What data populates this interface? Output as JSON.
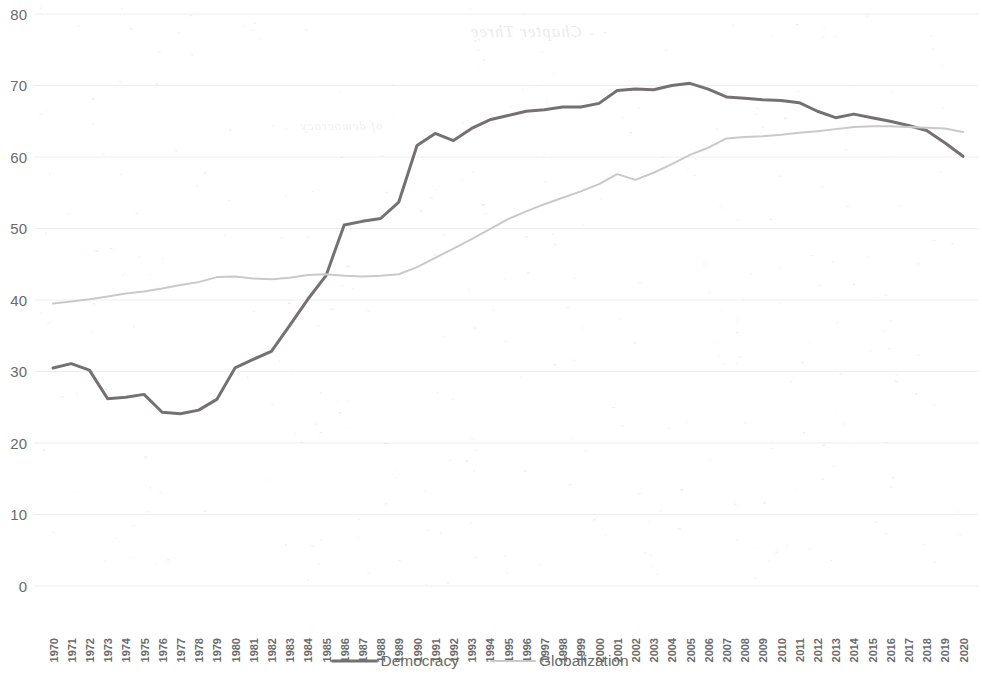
{
  "chart_data": {
    "type": "line",
    "title": "",
    "xlabel": "",
    "ylabel": "",
    "ylim": [
      0,
      80
    ],
    "ytick_step": 10,
    "yticks": [
      "0",
      "10",
      "20",
      "30",
      "40",
      "50",
      "60",
      "70",
      "80"
    ],
    "grid": true,
    "legend_position": "bottom",
    "x": [
      "1970",
      "1971",
      "1972",
      "1973",
      "1974",
      "1975",
      "1976",
      "1977",
      "1978",
      "1979",
      "1980",
      "1981",
      "1982",
      "1983",
      "1984",
      "1985",
      "1986",
      "1987",
      "1988",
      "1989",
      "1990",
      "1991",
      "1992",
      "1993",
      "1994",
      "1995",
      "1996",
      "1997",
      "1998",
      "1999",
      "2000",
      "2001",
      "2002",
      "2003",
      "2004",
      "2005",
      "2006",
      "2007",
      "2008",
      "2009",
      "2010",
      "2011",
      "2012",
      "2013",
      "2014",
      "2015",
      "2016",
      "2017",
      "2018",
      "2019",
      "2020"
    ],
    "series": [
      {
        "name": "Democracy",
        "color": "#767171",
        "width": 3.0,
        "values": [
          30.5,
          31.1,
          30.2,
          26.2,
          26.4,
          26.8,
          24.3,
          24.1,
          24.6,
          26.1,
          30.5,
          31.7,
          32.8,
          36.4,
          40.1,
          43.4,
          50.5,
          51.0,
          51.4,
          53.7,
          61.6,
          63.3,
          62.3,
          64.0,
          65.2,
          65.8,
          66.4,
          66.6,
          67.0,
          67.0,
          67.5,
          69.3,
          69.5,
          69.4,
          70.0,
          70.3,
          69.5,
          68.4,
          68.2,
          68.0,
          67.9,
          67.6,
          66.4,
          65.5,
          66.0,
          65.5,
          65.0,
          64.4,
          63.7,
          62.0,
          60.1
        ]
      },
      {
        "name": "Globalization",
        "color": "#c9c9c9",
        "width": 2.0,
        "values": [
          39.5,
          39.8,
          40.1,
          40.5,
          40.9,
          41.2,
          41.6,
          42.1,
          42.5,
          43.2,
          43.3,
          43.0,
          42.9,
          43.1,
          43.5,
          43.6,
          43.4,
          43.3,
          43.4,
          43.6,
          44.6,
          45.9,
          47.2,
          48.5,
          49.9,
          51.3,
          52.4,
          53.4,
          54.3,
          55.2,
          56.2,
          57.6,
          56.8,
          57.8,
          59.0,
          60.3,
          61.3,
          62.6,
          62.8,
          62.9,
          63.1,
          63.4,
          63.6,
          63.9,
          64.2,
          64.3,
          64.3,
          64.2,
          64.1,
          64.0,
          63.5
        ]
      }
    ],
    "legend": [
      {
        "label": "Democracy",
        "color": "#767171",
        "width": 3.0
      },
      {
        "label": "Globalization",
        "color": "#c9c9c9",
        "width": 2.0
      }
    ]
  },
  "artifacts": {
    "ghost_chapter": "Chapter Three",
    "ghost_band": "of democracy"
  }
}
